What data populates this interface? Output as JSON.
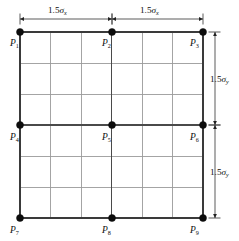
{
  "figure": {
    "background_color": "#ffffff"
  },
  "chart_data": {
    "type": "diagram",
    "grid": {
      "columns": 6,
      "rows": 6,
      "x_left": 20,
      "x_right": 203,
      "y_top": 32,
      "y_bottom": 218,
      "minor_line_color": "#9a9a9a",
      "major_line_color": "#4a4a4a",
      "outline_color": "#3a3a3a"
    },
    "nodes": [
      {
        "id": "P1",
        "base": "P",
        "sub": "1",
        "x": 20,
        "y": 32,
        "label_x": 10,
        "label_y": 46
      },
      {
        "id": "P2",
        "base": "P",
        "sub": "2",
        "x": 112,
        "y": 32,
        "label_x": 102,
        "label_y": 46
      },
      {
        "id": "P3",
        "base": "P",
        "sub": "3",
        "x": 203,
        "y": 32,
        "label_x": 190,
        "label_y": 46
      },
      {
        "id": "P4",
        "base": "P",
        "sub": "4",
        "x": 20,
        "y": 125,
        "label_x": 10,
        "label_y": 140
      },
      {
        "id": "P5",
        "base": "P",
        "sub": "5",
        "x": 112,
        "y": 125,
        "label_x": 102,
        "label_y": 140
      },
      {
        "id": "P6",
        "base": "P",
        "sub": "6",
        "x": 203,
        "y": 125,
        "label_x": 190,
        "label_y": 140
      },
      {
        "id": "P7",
        "base": "P",
        "sub": "7",
        "x": 20,
        "y": 218,
        "label_x": 10,
        "label_y": 233
      },
      {
        "id": "P8",
        "base": "P",
        "sub": "8",
        "x": 112,
        "y": 218,
        "label_x": 102,
        "label_y": 233
      },
      {
        "id": "P9",
        "base": "P",
        "sub": "9",
        "x": 203,
        "y": 218,
        "label_x": 190,
        "label_y": 233
      }
    ],
    "dimensions": [
      {
        "id": "dim-top-left",
        "orientation": "horizontal",
        "value": "1.5",
        "symbol": "σ",
        "subscript": "x",
        "from": 20,
        "to": 112,
        "axis_pos": 19,
        "label_x": 48,
        "label_y": 13
      },
      {
        "id": "dim-top-right",
        "orientation": "horizontal",
        "value": "1.5",
        "symbol": "σ",
        "subscript": "x",
        "from": 112,
        "to": 203,
        "axis_pos": 19,
        "label_x": 140,
        "label_y": 13
      },
      {
        "id": "dim-right-upper",
        "orientation": "vertical",
        "value": "1.5",
        "symbol": "σ",
        "subscript": "y",
        "from": 32,
        "to": 125,
        "axis_pos": 215,
        "label_x": 210,
        "label_y": 82
      },
      {
        "id": "dim-right-lower",
        "orientation": "vertical",
        "value": "1.5",
        "symbol": "σ",
        "subscript": "y",
        "from": 125,
        "to": 218,
        "axis_pos": 215,
        "label_x": 210,
        "label_y": 175
      }
    ],
    "axis_labels": {
      "x_spacing": "1.5σx",
      "y_spacing": "1.5σy"
    },
    "legend": [],
    "annotations": [
      "Nine nodal points P1 through P9 arranged at corners, edge midpoints and centre of a square mesh.",
      "Horizontal half-span equals 1.5 sigma-x; vertical half-span equals 1.5 sigma-y."
    ]
  }
}
